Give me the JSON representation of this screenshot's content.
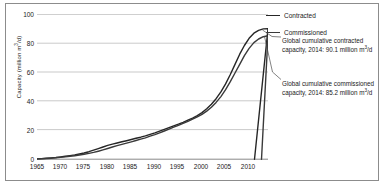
{
  "chart_data": {
    "type": "line",
    "title": "",
    "subtitle": "",
    "xlabel": "",
    "ylabel": "Capacity (million m³/d)",
    "ylabel_main": "Capacity (million m",
    "ylabel_sup": "3",
    "ylabel_tail": "/d)",
    "xlim": [
      1965,
      2014
    ],
    "ylim": [
      0,
      100
    ],
    "grid": true,
    "grid_axis": "y",
    "legend_position": "top-right",
    "x_tick_labels": [
      "1965",
      "1970",
      "1975",
      "1980",
      "1985",
      "1990",
      "1995",
      "2000",
      "2005",
      "2010"
    ],
    "x_tick_values": [
      1965,
      1970,
      1975,
      1980,
      1985,
      1990,
      1995,
      2000,
      2005,
      2010
    ],
    "y_tick_labels": [
      "0",
      "20",
      "40",
      "60",
      "80",
      "100"
    ],
    "y_tick_values": [
      0,
      20,
      40,
      60,
      80,
      100
    ],
    "x": [
      1965,
      1966,
      1967,
      1968,
      1969,
      1970,
      1971,
      1972,
      1973,
      1974,
      1975,
      1976,
      1977,
      1978,
      1979,
      1980,
      1981,
      1982,
      1983,
      1984,
      1985,
      1986,
      1987,
      1988,
      1989,
      1990,
      1991,
      1992,
      1993,
      1994,
      1995,
      1996,
      1997,
      1998,
      1999,
      2000,
      2001,
      2002,
      2003,
      2004,
      2005,
      2006,
      2007,
      2008,
      2009,
      2010,
      2011,
      2012,
      2013,
      2014
    ],
    "series": [
      {
        "name": "Contracted",
        "color": "#262626",
        "values": [
          0.2,
          0.4,
          0.6,
          0.9,
          1.2,
          1.6,
          2.0,
          2.5,
          3.0,
          3.6,
          4.3,
          5.2,
          6.2,
          7.3,
          8.4,
          9.5,
          10.4,
          11.2,
          12.0,
          12.8,
          13.6,
          14.4,
          15.2,
          16.1,
          17.1,
          18.2,
          19.4,
          20.6,
          21.8,
          23.0,
          24.2,
          25.5,
          26.9,
          28.4,
          30.1,
          32.2,
          34.8,
          38.0,
          41.8,
          46.5,
          52.0,
          58.5,
          65.5,
          72.5,
          78.5,
          83.5,
          87.0,
          89.0,
          90.0,
          90.1
        ],
        "end_value": 90.1
      },
      {
        "name": "Commissioned",
        "color": "#3a3a3a",
        "values": [
          0.15,
          0.3,
          0.45,
          0.7,
          0.95,
          1.25,
          1.6,
          2.0,
          2.4,
          2.9,
          3.4,
          4.0,
          4.7,
          5.5,
          6.4,
          7.4,
          8.4,
          9.3,
          10.2,
          11.1,
          12.0,
          12.9,
          13.8,
          14.8,
          15.9,
          17.0,
          18.2,
          19.5,
          20.8,
          22.1,
          23.4,
          24.7,
          26.1,
          27.6,
          29.2,
          31.0,
          33.2,
          35.9,
          39.2,
          43.2,
          48.0,
          53.5,
          59.5,
          65.5,
          71.5,
          76.5,
          80.5,
          83.0,
          84.6,
          85.2
        ],
        "end_value": 85.2
      }
    ],
    "annotations": [
      {
        "id": "contracted",
        "line1": "Global cumulative contracted",
        "line2_pre": "capacity, 2014: 90.1 million m",
        "line2_sup": "3",
        "line2_post": "/d",
        "target_year": 2014,
        "target_value": 90.1
      },
      {
        "id": "commissioned",
        "line1": "Global cumulative commissioned",
        "line2_pre": "capacity, 2014: 85.2 million m",
        "line2_sup": "3",
        "line2_post": "/d",
        "target_year": 2014,
        "target_value": 85.2
      }
    ],
    "legend": [
      {
        "label": "Contracted"
      },
      {
        "label": "Commissioned"
      }
    ]
  }
}
